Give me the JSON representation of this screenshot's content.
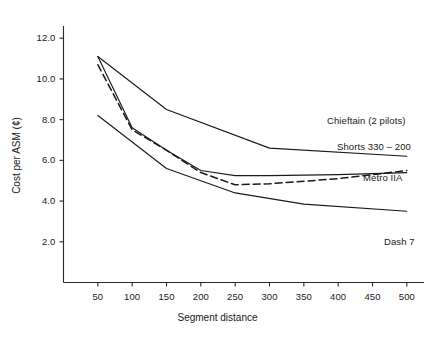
{
  "chart_data": {
    "type": "line",
    "title": "",
    "xlabel": "Segment distance",
    "ylabel": "Cost per ASM (¢)",
    "xlim": [
      0,
      525
    ],
    "ylim": [
      0,
      12.6
    ],
    "grid": false,
    "legend_position": "right-inline-labels",
    "xticks": [
      50,
      100,
      150,
      200,
      250,
      300,
      350,
      400,
      450,
      500
    ],
    "xtick_labels": [
      "50",
      "100",
      "150",
      "200",
      "250",
      "300",
      "350",
      "400",
      "450",
      "500"
    ],
    "yticks": [
      2.0,
      4.0,
      6.0,
      8.0,
      10.0,
      12.0
    ],
    "ytick_labels": [
      "2.0",
      "4.0",
      "6.0",
      "8.0",
      "10.0",
      "12.0"
    ],
    "series": [
      {
        "name": "Chieftain (2 pilots)",
        "style": "solid",
        "label": "Chieftain (2 pilots)",
        "x": [
          50,
          150,
          300,
          500
        ],
        "values": [
          11.1,
          8.5,
          6.6,
          6.2
        ]
      },
      {
        "name": "Shorts 330 – 200",
        "style": "dashed",
        "label": "Shorts 330 – 200",
        "x": [
          50,
          100,
          150,
          200,
          250,
          300,
          400,
          500
        ],
        "values": [
          10.7,
          7.5,
          6.5,
          5.4,
          4.8,
          4.85,
          5.1,
          5.5
        ]
      },
      {
        "name": "Metro IIA",
        "style": "solid",
        "label": "Metro IIA",
        "x": [
          50,
          100,
          150,
          200,
          250,
          300,
          400,
          500
        ],
        "values": [
          11.1,
          7.6,
          6.5,
          5.5,
          5.25,
          5.25,
          5.3,
          5.4
        ]
      },
      {
        "name": "Dash 7",
        "style": "solid",
        "label": "Dash 7",
        "x": [
          50,
          150,
          250,
          350,
          500
        ],
        "values": [
          8.2,
          5.6,
          4.4,
          3.85,
          3.5
        ]
      }
    ]
  },
  "axis": {
    "ylabel": "Cost per ASM (¢)",
    "xlabel": "Segment distance"
  },
  "series_labels": {
    "chieftain": "Chieftain (2 pilots)",
    "shorts": "Shorts 330 – 200",
    "metro": "Metro IIA",
    "dash7": "Dash 7"
  }
}
